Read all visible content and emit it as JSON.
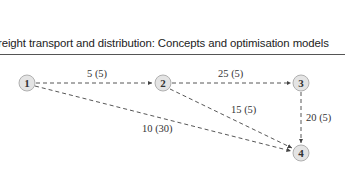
{
  "header": {
    "title": "reight transport and distribution: Concepts and optimisation models"
  },
  "diagram": {
    "nodes": [
      {
        "id": "1",
        "label": "1"
      },
      {
        "id": "2",
        "label": "2"
      },
      {
        "id": "3",
        "label": "3"
      },
      {
        "id": "4",
        "label": "4"
      }
    ],
    "edges": [
      {
        "from": "1",
        "to": "2",
        "label": "5 (5)"
      },
      {
        "from": "2",
        "to": "3",
        "label": "25 (5)"
      },
      {
        "from": "2",
        "to": "4",
        "label": "15 (5)"
      },
      {
        "from": "3",
        "to": "4",
        "label": "20 (5)"
      },
      {
        "from": "1",
        "to": "4",
        "label": "10 (30)"
      }
    ],
    "colors": {
      "node_fill": "#e4e4e4",
      "node_stroke": "#b0b0b0",
      "edge": "#444444"
    }
  }
}
